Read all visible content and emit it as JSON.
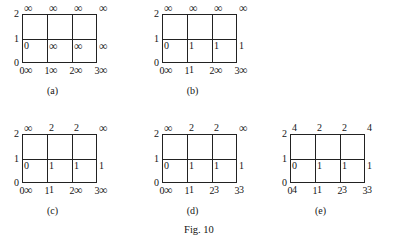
{
  "figure": {
    "caption": "Fig. 10",
    "axis": {
      "x_ticks": [
        "0",
        "1",
        "2",
        "3"
      ],
      "y_ticks": [
        "0",
        "1",
        "2"
      ]
    },
    "panels": [
      {
        "id": "a",
        "caption": "(a)",
        "rows": [
          {
            "y": "2",
            "values": [
              "∞",
              "∞",
              "∞",
              "∞"
            ]
          },
          {
            "y": "1",
            "values": [
              "0",
              "∞",
              "∞",
              "∞"
            ]
          },
          {
            "y": "0",
            "values": [
              "∞",
              "∞",
              "∞",
              "∞"
            ]
          }
        ]
      },
      {
        "id": "b",
        "caption": "(b)",
        "rows": [
          {
            "y": "2",
            "values": [
              "∞",
              "∞",
              "∞",
              "∞"
            ]
          },
          {
            "y": "1",
            "values": [
              "0",
              "1",
              "1",
              "1"
            ]
          },
          {
            "y": "0",
            "values": [
              "∞",
              "1",
              "∞",
              "∞"
            ]
          }
        ]
      },
      {
        "id": "c",
        "caption": "(c)",
        "rows": [
          {
            "y": "2",
            "values": [
              "∞",
              "2",
              "2",
              "∞"
            ]
          },
          {
            "y": "1",
            "values": [
              "0",
              "1",
              "1",
              "1"
            ]
          },
          {
            "y": "0",
            "values": [
              "∞",
              "1",
              "∞",
              "∞"
            ]
          }
        ]
      },
      {
        "id": "d",
        "caption": "(d)",
        "rows": [
          {
            "y": "2",
            "values": [
              "∞",
              "2",
              "2",
              "∞"
            ]
          },
          {
            "y": "1",
            "values": [
              "0",
              "1",
              "1",
              "1"
            ]
          },
          {
            "y": "0",
            "values": [
              "∞",
              "1",
              "3",
              "3"
            ]
          }
        ]
      },
      {
        "id": "e",
        "caption": "(e)",
        "rows": [
          {
            "y": "2",
            "values": [
              "4",
              "2",
              "2",
              "4"
            ]
          },
          {
            "y": "1",
            "values": [
              "0",
              "1",
              "1",
              "1"
            ]
          },
          {
            "y": "0",
            "values": [
              "4",
              "1",
              "3",
              "3"
            ]
          }
        ]
      }
    ]
  }
}
